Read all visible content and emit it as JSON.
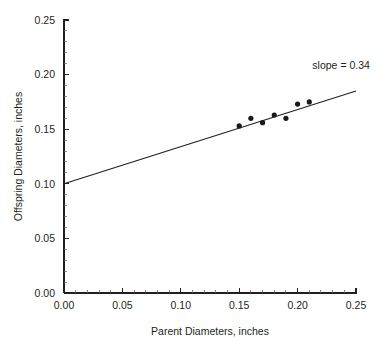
{
  "chart_data": {
    "type": "scatter",
    "title": "",
    "xlabel": "Parent Diameters, inches",
    "ylabel": "Offspring Diameters, inches",
    "xlim": [
      0.0,
      0.25
    ],
    "ylim": [
      0.0,
      0.25
    ],
    "grid": false,
    "legend": "none",
    "x_ticks": [
      0.0,
      0.05,
      0.1,
      0.15,
      0.2,
      0.25
    ],
    "y_ticks": [
      0.0,
      0.05,
      0.1,
      0.15,
      0.2,
      0.25
    ],
    "x_tick_labels": [
      "0.00",
      "0.05",
      "0.10",
      "0.15",
      "0.20",
      "0.25"
    ],
    "y_tick_labels": [
      "0.00",
      "0.05",
      "0.10",
      "0.15",
      "0.20",
      "0.25"
    ],
    "x_minor_tick_step": 0.01,
    "y_minor_tick_step": 0.01,
    "x": [
      0.15,
      0.16,
      0.17,
      0.18,
      0.19,
      0.2,
      0.21
    ],
    "y": [
      0.153,
      0.16,
      0.156,
      0.163,
      0.16,
      0.173,
      0.175
    ],
    "points": [
      {
        "x": 0.15,
        "y": 0.153
      },
      {
        "x": 0.16,
        "y": 0.16
      },
      {
        "x": 0.17,
        "y": 0.156
      },
      {
        "x": 0.18,
        "y": 0.163
      },
      {
        "x": 0.19,
        "y": 0.16
      },
      {
        "x": 0.2,
        "y": 0.173
      },
      {
        "x": 0.21,
        "y": 0.175
      }
    ],
    "marker": {
      "shape": "circle",
      "size_px": 2.6,
      "color": "#1a1a1a"
    },
    "fit_line": {
      "type": "linear",
      "slope": 0.34,
      "intercept": 0.1,
      "x_start": 0.0,
      "y_start": 0.1,
      "x_end": 0.25,
      "y_end": 0.185,
      "color": "#231f20"
    },
    "annotations": [
      {
        "name": "slope-annotation",
        "text": "slope = 0.34",
        "x": 0.215,
        "y": 0.205
      }
    ],
    "axes_style": {
      "spines": [
        "left",
        "bottom"
      ],
      "axis_color": "#231f20",
      "background": "#ffffff"
    }
  },
  "labels": {
    "xlabel": "Parent Diameters, inches",
    "ylabel": "Offspring Diameters, inches",
    "slope_annotation": "slope = 0.34"
  },
  "ticks": {
    "x": [
      "0.00",
      "0.05",
      "0.10",
      "0.15",
      "0.20",
      "0.25"
    ],
    "y": [
      "0.00",
      "0.05",
      "0.10",
      "0.15",
      "0.20",
      "0.25"
    ]
  }
}
